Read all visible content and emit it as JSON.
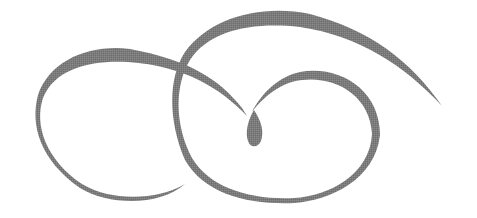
{
  "image": {
    "kind": "decorative calligraphic flourish",
    "width": 477,
    "height": 218,
    "background": "#ffffff",
    "stroke_color": "#7b7b7b"
  }
}
